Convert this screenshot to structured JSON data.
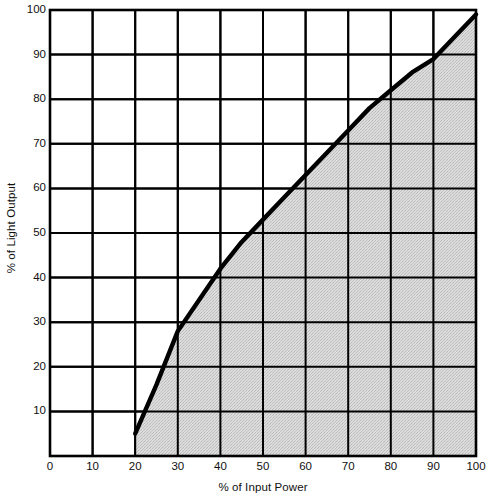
{
  "chart_data": {
    "type": "area",
    "title": "",
    "subtitle": "",
    "xlabel": "% of Input Power",
    "ylabel": "% of Light Output",
    "xlim": [
      0,
      100
    ],
    "ylim": [
      0,
      100
    ],
    "xticks": [
      0,
      10,
      20,
      30,
      40,
      50,
      60,
      70,
      80,
      90,
      100
    ],
    "yticks": [
      10,
      20,
      30,
      40,
      50,
      60,
      70,
      80,
      90,
      100
    ],
    "xtick_labels": [
      "0",
      "10",
      "20",
      "30",
      "40",
      "50",
      "60",
      "70",
      "80",
      "90",
      "100"
    ],
    "ytick_labels": [
      "10",
      "20",
      "30",
      "40",
      "50",
      "60",
      "70",
      "80",
      "90",
      "100"
    ],
    "grid": true,
    "grid_spacing_x": 10,
    "grid_spacing_y": 10,
    "legend": null,
    "legend_position": "none",
    "fill": true,
    "fill_color": "#d2d2d2",
    "line_color": "#000000",
    "line_width": 4,
    "series": [
      {
        "name": "Light output vs input power",
        "x": [
          20,
          25,
          30,
          35,
          40,
          45,
          50,
          55,
          60,
          65,
          70,
          75,
          80,
          85,
          90,
          95,
          100
        ],
        "values": [
          5,
          16,
          28,
          35,
          42,
          48,
          53,
          58,
          63,
          68,
          73,
          78,
          82,
          86,
          89,
          94,
          99
        ]
      }
    ],
    "annotations": []
  },
  "axes": {
    "y_axis_title": "% of Light Output",
    "x_axis_title": "% of Input Power"
  }
}
